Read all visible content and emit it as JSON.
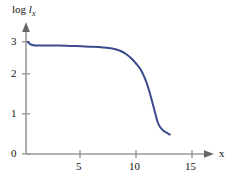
{
  "chart_data": {
    "type": "line",
    "title": "",
    "subtitle": "",
    "xlabel": "x",
    "ylabel": "log l_x",
    "ylabel_parts": {
      "prefix": "log ",
      "symbol": "l",
      "subscript": "x"
    },
    "xlim": [
      0,
      16
    ],
    "ylim": [
      0,
      3.3
    ],
    "grid": false,
    "legend": false,
    "legend_position": "none",
    "x_ticks": [
      5,
      10,
      15
    ],
    "x_tick_labels": [
      "5",
      "10",
      "15"
    ],
    "y_ticks": [
      0,
      1,
      2,
      3
    ],
    "y_tick_labels": [
      "0",
      "1",
      "2",
      "3"
    ],
    "series": [
      {
        "name": "survivorship",
        "color": "#3b4a8c",
        "x": [
          0.15,
          0.5,
          1.0,
          1.5,
          2.0,
          3.0,
          4.0,
          5.0,
          6.0,
          7.0,
          7.8,
          8.5,
          9.0,
          9.5,
          10.0,
          10.4,
          10.8,
          11.1,
          11.4,
          11.7,
          11.9,
          12.1,
          12.4,
          12.7,
          13.0
        ],
        "y": [
          3.0,
          2.92,
          2.9,
          2.9,
          2.9,
          2.9,
          2.89,
          2.88,
          2.87,
          2.85,
          2.82,
          2.76,
          2.68,
          2.56,
          2.4,
          2.24,
          1.98,
          1.72,
          1.4,
          1.06,
          0.85,
          0.73,
          0.63,
          0.57,
          0.52
        ]
      }
    ],
    "annotations": []
  },
  "axis": {
    "x_arrow": "arrow-right",
    "y_arrow": "arrow-up",
    "color": "#999999"
  }
}
